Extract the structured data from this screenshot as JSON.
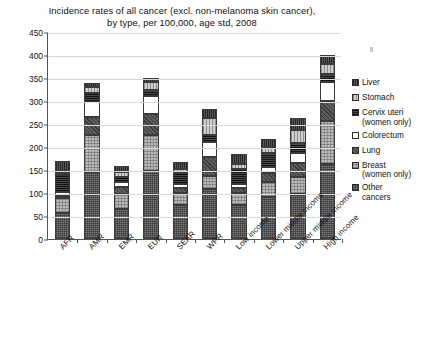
{
  "chart": {
    "title_line1": "Incidence rates of all cancer (excl. non-melanoma skin cancer),",
    "title_line2": "by type, per 100,000, age std, 2008"
  },
  "chart_data": {
    "type": "bar",
    "subtype": "stacked-bar",
    "title": "Incidence rates of all cancer (excl. non-melanoma skin cancer), by type, per 100,000, age std, 2008",
    "xlabel": "",
    "ylabel": "",
    "ylim": [
      0,
      450
    ],
    "yticks": [
      0,
      50,
      100,
      150,
      200,
      250,
      300,
      350,
      400,
      450
    ],
    "grid": true,
    "legend_position": "right",
    "categories": [
      "AFR",
      "AMR",
      "EMR",
      "EUR",
      "SEAR",
      "WPR",
      "Low income",
      "Lower middle income",
      "Upper middle income",
      "High income"
    ],
    "series": [
      {
        "name": "Other cancers",
        "values": [
          57,
          145,
          65,
          147,
          73,
          109,
          73,
          91,
          98,
          162
        ]
      },
      {
        "name": "Breast (women only)",
        "values": [
          33,
          82,
          33,
          80,
          26,
          28,
          28,
          33,
          37,
          94
        ]
      },
      {
        "name": "Lung",
        "values": [
          4,
          38,
          15,
          45,
          12,
          42,
          10,
          19,
          31,
          43
        ]
      },
      {
        "name": "Colorectum",
        "values": [
          7,
          32,
          10,
          38,
          8,
          31,
          9,
          14,
          21,
          43
        ]
      },
      {
        "name": "Cervix uteri (women only)",
        "values": [
          37,
          20,
          12,
          15,
          24,
          16,
          32,
          29,
          22,
          16
        ]
      },
      {
        "name": "Stomach",
        "values": [
          6,
          13,
          11,
          16,
          10,
          37,
          11,
          13,
          28,
          22
        ]
      },
      {
        "name": "Liver",
        "values": [
          26,
          10,
          13,
          9,
          14,
          19,
          22,
          18,
          26,
          20
        ]
      }
    ],
    "totals": [
      170,
      340,
      159,
      350,
      167,
      282,
      185,
      217,
      263,
      400
    ]
  },
  "legend": {
    "items": [
      {
        "label": "Liver",
        "swatch": "liver-swatch"
      },
      {
        "label": "Stomach",
        "swatch": "stomach-swatch"
      },
      {
        "label": "Cervix uteri\n(women only)",
        "swatch": "cervix-swatch"
      },
      {
        "label": "Colorectum",
        "swatch": "colorectum-swatch"
      },
      {
        "label": "Lung",
        "swatch": "lung-swatch"
      },
      {
        "label": "Breast\n(women only)",
        "swatch": "breast-swatch"
      },
      {
        "label": "Other\ncancers",
        "swatch": "other-swatch"
      }
    ]
  }
}
